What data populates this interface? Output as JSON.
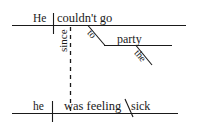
{
  "diagram": {
    "type": "reed-kellogg-sentence-diagram",
    "sentence": "He couldn't go to the party since he was feeling sick",
    "ink_color": "#1a1a1a",
    "background_color": "#ffffff",
    "main_clause": {
      "subject": "He",
      "predicate": "couldn't go",
      "prepositional_phrase": {
        "preposition": "to",
        "object": "party",
        "article": "the"
      }
    },
    "connector": {
      "conjunction": "since",
      "line_style": "dashed",
      "orientation": "vertical"
    },
    "subordinate_clause": {
      "subject": "he",
      "predicate": "was feeling",
      "complement": "sick"
    }
  }
}
